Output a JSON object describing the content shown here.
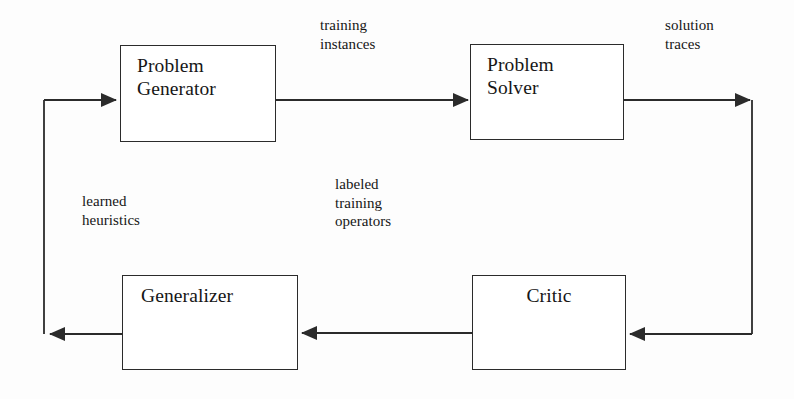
{
  "diagram": {
    "type": "flow-diagram",
    "background_color": "#fdfdfd",
    "line_color": "#2b2b2b",
    "text_color": "#161616",
    "nodes": [
      {
        "id": "problem-generator",
        "label": "Problem\nGenerator"
      },
      {
        "id": "problem-solver",
        "label": "Problem\nSolver"
      },
      {
        "id": "critic",
        "label": "Critic"
      },
      {
        "id": "generalizer",
        "label": "Generalizer"
      }
    ],
    "edge_labels": [
      {
        "id": "training-instances",
        "text": "training\ninstances"
      },
      {
        "id": "solution-traces",
        "text": "solution\ntraces"
      },
      {
        "id": "learned-heuristics",
        "text": "learned\nheuristics"
      },
      {
        "id": "labeled-training-operators",
        "text": "labeled\ntraining\noperators"
      }
    ],
    "edges": [
      {
        "from": "problem-generator",
        "to": "problem-solver",
        "label": "training instances",
        "direction": "right"
      },
      {
        "from": "problem-solver",
        "to": "critic",
        "label": "solution traces",
        "direction": "right-down-left"
      },
      {
        "from": "critic",
        "to": "generalizer",
        "label": "labeled training operators",
        "direction": "left"
      },
      {
        "from": "generalizer",
        "to": "problem-generator",
        "label": "learned heuristics",
        "direction": "left-up-right"
      }
    ]
  }
}
